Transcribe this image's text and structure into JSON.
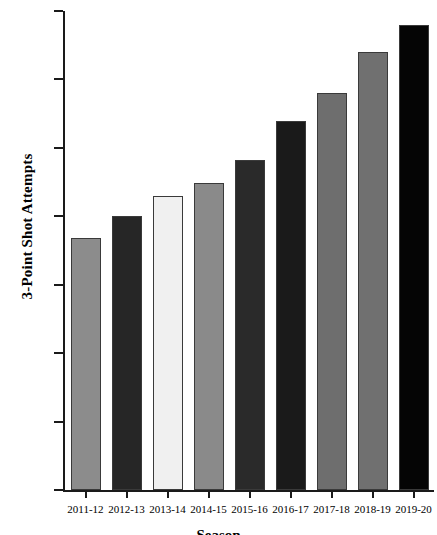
{
  "chart_data": {
    "type": "bar",
    "title": "",
    "xlabel": "Season",
    "ylabel": "3-Point Shot Attempts",
    "categories": [
      "2011-12",
      "2012-13",
      "2013-14",
      "2014-15",
      "2015-16",
      "2016-17",
      "2017-18",
      "2018-19",
      "2019-20"
    ],
    "values": [
      18.4,
      20.0,
      21.5,
      22.4,
      24.1,
      27.0,
      29.0,
      32.0,
      34.0
    ],
    "ylim": [
      0,
      35
    ],
    "yticks": [
      0,
      5,
      10,
      15,
      20,
      25,
      30,
      35
    ],
    "ytick_labels": [
      "0",
      "5",
      "10",
      "15",
      "20",
      "25",
      "30",
      "35"
    ],
    "grid": false,
    "legend": "none",
    "bar_colors": [
      "#8c8c8c",
      "#262626",
      "#f0f0f0",
      "#8a8a8a",
      "#2a2a2a",
      "#1a1a1a",
      "#6e6e6e",
      "#707070",
      "#050505"
    ]
  },
  "axis": {
    "y_title": "3-Point Shot Attempts",
    "x_title": "Season"
  }
}
